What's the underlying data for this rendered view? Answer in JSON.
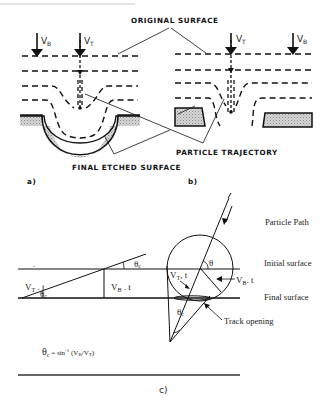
{
  "figure": {
    "top_strip_text": "",
    "panel_a": {
      "tag": "a)",
      "arrows": [
        {
          "symbol": "V",
          "subscript": "B"
        },
        {
          "symbol": "V",
          "subscript": "T"
        }
      ]
    },
    "panel_b": {
      "tag": "b)",
      "arrows": [
        {
          "symbol": "V",
          "subscript": "T"
        },
        {
          "symbol": "V",
          "subscript": "B"
        }
      ]
    },
    "labels": {
      "original_surface": "ORIGINAL SURFACE",
      "particle_trajectory": "PARTICLE TRAJECTORY",
      "final_etched_surface": "FINAL ETCHED SURFACE"
    },
    "panel_c": {
      "tag": "c)",
      "particle_path": "Particle Path",
      "initial_surface": "Initial surface",
      "final_surface": "Final surface",
      "track_opening": "Track opening",
      "vt_t": {
        "symbol": "V",
        "subscript": "T",
        "suffix": " . t"
      },
      "vb_t": {
        "symbol": "V",
        "subscript": "B",
        "suffix": " . t"
      },
      "vt_t_circle": {
        "symbol": "V",
        "subscript": "T",
        "suffix": ", t"
      },
      "vb_t_circle": {
        "symbol": "V",
        "subscript": "B",
        "suffix": ". t"
      },
      "theta": "θ",
      "theta_c": {
        "symbol": "θ",
        "subscript": "c"
      },
      "formula": {
        "lhs_symbol": "θ",
        "lhs_subscript": "c",
        "rhs_prefix": " = sin",
        "rhs_sup": "-1",
        "rhs_args": " (V",
        "arg1_sub": "B",
        "mid": "/V",
        "arg2_sub": "T",
        "close": ")"
      }
    }
  }
}
